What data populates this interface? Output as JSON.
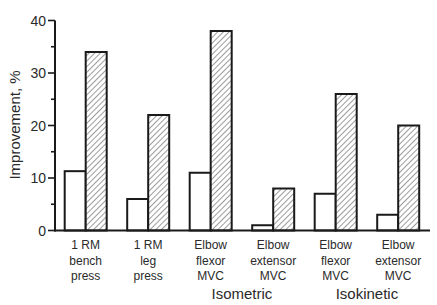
{
  "chart_data": {
    "type": "bar",
    "title": "",
    "xlabel": "",
    "ylabel": "Improvement, %",
    "ylim": [
      0,
      40
    ],
    "yticks": [
      0,
      10,
      20,
      30,
      40
    ],
    "minor_yticks": [
      5,
      15,
      25,
      35
    ],
    "grid": false,
    "legend": null,
    "categories": [
      [
        "1 RM",
        "bench",
        "press"
      ],
      [
        "1 RM",
        "leg",
        "press"
      ],
      [
        "Elbow",
        "flexor",
        "MVC"
      ],
      [
        "Elbow",
        "extensor",
        "MVC"
      ],
      [
        "Elbow",
        "flexor",
        "MVC"
      ],
      [
        "Elbow",
        "extensor",
        "MVC"
      ]
    ],
    "category_names": [
      "1 RM bench press",
      "1 RM leg press",
      "Isometric Elbow flexor MVC",
      "Isometric Elbow extensor MVC",
      "Isokinetic Elbow flexor MVC",
      "Isokinetic Elbow extensor MVC"
    ],
    "group_labels": [
      {
        "label": "Isometric",
        "categories": [
          2,
          3
        ]
      },
      {
        "label": "Isokinetic",
        "categories": [
          4,
          5
        ]
      }
    ],
    "series": [
      {
        "name": "open bars",
        "fill": "#ffffff",
        "pattern": "none",
        "values": [
          11.3,
          6,
          11,
          1,
          7,
          3
        ]
      },
      {
        "name": "hatched bars",
        "fill": "#ffffff",
        "pattern": "diagonal-hatch",
        "values": [
          34,
          22,
          38,
          8,
          26,
          20
        ]
      }
    ]
  },
  "colors": {
    "axis": "#1a1a1a",
    "text": "#2a2a2a",
    "hatch": "#555555",
    "background": "#ffffff"
  }
}
